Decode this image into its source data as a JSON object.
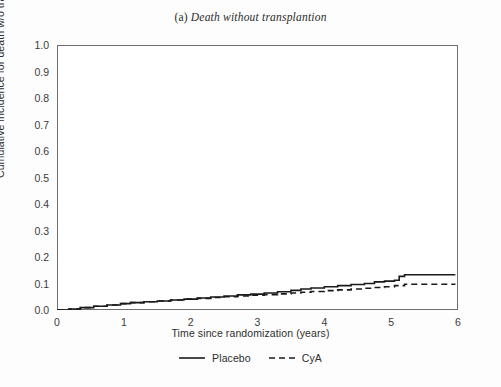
{
  "figure": {
    "panel_label": "(a)",
    "title": "Death without transplantion"
  },
  "axes": {
    "x_title": "Time since randomization (years)",
    "y_title": "Cumulative incidence for death w/o transplantation",
    "x_ticks": [
      "0",
      "1",
      "2",
      "3",
      "4",
      "5",
      "6"
    ],
    "y_ticks": [
      "0.0",
      "0.1",
      "0.2",
      "0.3",
      "0.4",
      "0.5",
      "0.6",
      "0.7",
      "0.8",
      "0.9",
      "1.0"
    ]
  },
  "legend": {
    "entries": [
      {
        "label": "Placebo",
        "style": "solid"
      },
      {
        "label": "CyA",
        "style": "dashed"
      }
    ]
  },
  "colors": {
    "line": "#1a1a1a",
    "axis": "#6f6f6f",
    "text": "#2e2e2e",
    "background": "#fdfdfd"
  },
  "chart_data": {
    "type": "line",
    "title": "(a) Death without transplantion",
    "xlabel": "Time since randomization (years)",
    "ylabel": "Cumulative incidence for death w/o transplantation",
    "xlim": [
      0,
      6
    ],
    "ylim": [
      0,
      1
    ],
    "xticks": [
      0,
      1,
      2,
      3,
      4,
      5,
      6
    ],
    "yticks": [
      0.0,
      0.1,
      0.2,
      0.3,
      0.4,
      0.5,
      0.6,
      0.7,
      0.8,
      0.9,
      1.0
    ],
    "grid": false,
    "legend_position": "below",
    "step_type": "post",
    "series": [
      {
        "name": "Placebo",
        "style": "solid",
        "x": [
          0.0,
          0.18,
          0.35,
          0.55,
          0.75,
          0.95,
          1.1,
          1.3,
          1.5,
          1.7,
          1.9,
          2.1,
          2.3,
          2.5,
          2.7,
          2.9,
          3.1,
          3.3,
          3.5,
          3.65,
          3.8,
          4.0,
          4.2,
          4.4,
          4.6,
          4.75,
          4.9,
          5.05,
          5.12,
          5.2,
          5.95
        ],
        "y": [
          0.0,
          0.004,
          0.009,
          0.014,
          0.019,
          0.024,
          0.028,
          0.031,
          0.034,
          0.038,
          0.041,
          0.045,
          0.049,
          0.053,
          0.057,
          0.06,
          0.064,
          0.069,
          0.074,
          0.079,
          0.083,
          0.088,
          0.092,
          0.096,
          0.1,
          0.106,
          0.109,
          0.112,
          0.127,
          0.133,
          0.135
        ]
      },
      {
        "name": "CyA",
        "style": "dashed",
        "x": [
          0.0,
          0.18,
          0.35,
          0.55,
          0.75,
          0.95,
          1.1,
          1.3,
          1.5,
          1.7,
          1.9,
          2.1,
          2.3,
          2.5,
          2.7,
          2.9,
          3.1,
          3.3,
          3.5,
          3.65,
          3.8,
          4.0,
          4.2,
          4.4,
          4.6,
          4.75,
          4.9,
          5.05,
          5.2,
          5.95
        ],
        "y": [
          0.0,
          0.004,
          0.009,
          0.014,
          0.019,
          0.024,
          0.028,
          0.031,
          0.034,
          0.038,
          0.041,
          0.044,
          0.047,
          0.05,
          0.053,
          0.056,
          0.058,
          0.061,
          0.064,
          0.067,
          0.07,
          0.073,
          0.076,
          0.079,
          0.082,
          0.085,
          0.088,
          0.092,
          0.097,
          0.1
        ]
      }
    ]
  }
}
